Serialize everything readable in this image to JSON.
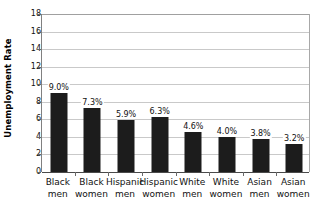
{
  "chart_data": {
    "type": "bar",
    "title": "",
    "subtitle": "",
    "xlabel": "",
    "ylabel": "Unemployment Rate",
    "ylim": [
      0,
      18
    ],
    "ytick_step": 2,
    "yticks": [
      "18",
      "16",
      "14",
      "12",
      "10",
      "8",
      "6",
      "4",
      "2",
      "0"
    ],
    "grid": true,
    "legend": false,
    "categories": [
      "Black men",
      "Black women",
      "Hispanic men",
      "Hispanic women",
      "White men",
      "White women",
      "Asian men",
      "Asian women"
    ],
    "category_lines": [
      {
        "line1": "Black",
        "line2": "men"
      },
      {
        "line1": "Black",
        "line2": "women"
      },
      {
        "line1": "Hispanic",
        "line2": "men"
      },
      {
        "line1": "Hispanic",
        "line2": "women"
      },
      {
        "line1": "White",
        "line2": "men"
      },
      {
        "line1": "White",
        "line2": "women"
      },
      {
        "line1": "Asian",
        "line2": "men"
      },
      {
        "line1": "Asian",
        "line2": "women"
      }
    ],
    "values": [
      9.0,
      7.3,
      5.9,
      6.3,
      4.6,
      4.0,
      3.8,
      3.2
    ],
    "data_labels": [
      "9.0%",
      "7.3%",
      "5.9%",
      "6.3%",
      "4.6%",
      "4.0%",
      "3.8%",
      "3.2%"
    ],
    "bar_color": "#1c1c1c",
    "gridline_color": "#c9c9c9",
    "axis_color": "#4a4a4a",
    "background_color": "#ffffff"
  }
}
